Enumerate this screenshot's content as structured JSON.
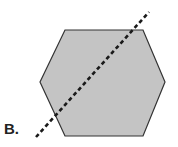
{
  "figure": {
    "label": "B.",
    "shape": "hexagon",
    "fill_color": "#c4c4c4",
    "stroke_color": "#333333",
    "hexagon_points": "65,30 143,30 165,82 143,136 65,136 40,82",
    "line": {
      "style": "dashed",
      "color": "#1a1a1a",
      "x1": 36,
      "y1": 137,
      "x2": 149,
      "y2": 12
    }
  }
}
